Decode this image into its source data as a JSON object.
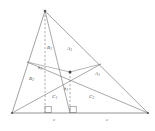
{
  "figure": {
    "stroke_color": "#7a7a7a",
    "dash_color": "#8a8a8a",
    "label_color": "#4a4a4a",
    "background": "#ffffff",
    "vertices": {
      "apex": {
        "x": 45,
        "y": 11,
        "name": "apex-vertex"
      },
      "left": {
        "x": 12,
        "y": 113,
        "name": "left-vertex"
      },
      "right": {
        "x": 148,
        "y": 113,
        "name": "right-vertex"
      }
    },
    "interior_point": {
      "x": 70,
      "y": 72,
      "name": "interior-intersection-point"
    },
    "foot_left": {
      "x": 45,
      "y": 113,
      "name": "altitude-foot-left"
    },
    "foot_center": {
      "x": 70,
      "y": 113,
      "name": "altitude-foot-center"
    },
    "side_point_left": {
      "x": 27,
      "y": 62,
      "name": "left-side-point"
    },
    "side_point_right": {
      "x": 101,
      "y": 64,
      "name": "right-side-point"
    },
    "region_labels": [
      {
        "id": "B1",
        "text": "B",
        "sub": "1",
        "x": 49,
        "y": 48
      },
      {
        "id": "A2",
        "text": "A",
        "sub": "2",
        "x": 69,
        "y": 49
      },
      {
        "id": "B2",
        "text": "B",
        "sub": "2",
        "x": 31,
        "y": 79
      },
      {
        "id": "A1",
        "text": "A",
        "sub": "1",
        "x": 97,
        "y": 74
      },
      {
        "id": "C1",
        "text": "C",
        "sub": "1",
        "x": 54,
        "y": 97
      },
      {
        "id": "C2",
        "text": "C",
        "sub": "2",
        "x": 91,
        "y": 97
      }
    ],
    "altitude_labels": [
      {
        "id": "h2",
        "text": "h",
        "sub": "2",
        "x": 40,
        "y": 69
      },
      {
        "id": "h1",
        "text": "h",
        "sub": "1",
        "x": 66,
        "y": 90
      }
    ],
    "base_labels": [
      {
        "id": "c-left",
        "text": "c",
        "x": 54,
        "y": 121
      },
      {
        "id": "c-right",
        "text": "c",
        "x": 107,
        "y": 121
      }
    ],
    "right_angle_markers": [
      {
        "id": "ra-left",
        "x": 45,
        "y": 113
      },
      {
        "id": "ra-center",
        "x": 70,
        "y": 113
      }
    ]
  }
}
